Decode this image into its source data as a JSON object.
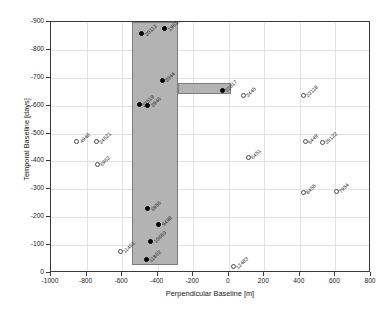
{
  "chart_data": {
    "type": "scatter",
    "title": "",
    "xlabel": "Perpendicular Baseline [m]",
    "ylabel": "Temporal Baseline [days]",
    "xlim": [
      -1000,
      800
    ],
    "ylim": [
      -900,
      0
    ],
    "xticks": [
      -1000,
      -800,
      -600,
      -400,
      -200,
      0,
      200,
      400,
      600,
      800
    ],
    "xticklabels": [
      "-1000",
      "-800",
      "-600",
      "-400",
      "-200",
      "0",
      "200",
      "400",
      "600",
      "800"
    ],
    "yticks": [
      -900,
      -800,
      -700,
      -600,
      -500,
      -400,
      -300,
      -200,
      -100,
      0
    ],
    "yticklabels": [
      "-900",
      "-800",
      "-700",
      "-600",
      "-500",
      "-400",
      "-300",
      "-200",
      "-100",
      "0"
    ],
    "grid": true,
    "legend": null,
    "shaded_regions": [
      {
        "name": "main-selection-box",
        "x0": -542,
        "x1": -285,
        "y0": -900,
        "y1": -30,
        "color": "#b3b3b3"
      },
      {
        "name": "horizontal-extension-bar",
        "x0": -285,
        "x1": 13,
        "y0": -680,
        "y1": -640,
        "color": "#b3b3b3"
      }
    ],
    "series": [
      {
        "name": "selected",
        "marker": "filled",
        "points": [
          {
            "label": "20112",
            "x": -490,
            "y": -858
          },
          {
            "label": "19611",
            "x": -360,
            "y": -875
          },
          {
            "label": "2044",
            "x": -375,
            "y": -692
          },
          {
            "label": "23519",
            "x": -505,
            "y": -603
          },
          {
            "label": "3946",
            "x": -455,
            "y": -601
          },
          {
            "label": "22817",
            "x": -37,
            "y": -655
          },
          {
            "label": "6956",
            "x": -455,
            "y": -231
          },
          {
            "label": "9498",
            "x": -395,
            "y": -174
          },
          {
            "label": "10660",
            "x": -440,
            "y": -113
          },
          {
            "label": "11862",
            "x": -465,
            "y": -48
          }
        ]
      },
      {
        "name": "unselected",
        "marker": "open",
        "points": [
          {
            "label": "4948",
            "x": -855,
            "y": -473
          },
          {
            "label": "24621",
            "x": -745,
            "y": -470
          },
          {
            "label": "6962",
            "x": -740,
            "y": -390
          },
          {
            "label": "11461",
            "x": -610,
            "y": -78
          },
          {
            "label": "3445",
            "x": 80,
            "y": -637
          },
          {
            "label": "23118",
            "x": 420,
            "y": -637
          },
          {
            "label": "5449",
            "x": 430,
            "y": -470
          },
          {
            "label": "25122",
            "x": 525,
            "y": -468
          },
          {
            "label": "8455",
            "x": 420,
            "y": -290
          },
          {
            "label": "7954",
            "x": 605,
            "y": -294
          },
          {
            "label": "6451",
            "x": 110,
            "y": -415
          },
          {
            "label": "12483",
            "x": 25,
            "y": -22
          }
        ]
      }
    ]
  }
}
